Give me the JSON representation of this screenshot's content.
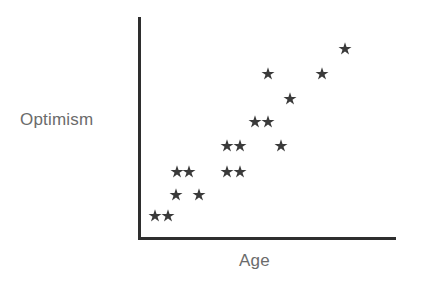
{
  "figure": {
    "background_color": "#ffffff",
    "axis_color": "#2e2e2e",
    "label_color": "#6b6b6b",
    "marker_color": "#3a3a3a",
    "marker_glyph": "asterisk-star"
  },
  "axes": {
    "x_label": "Age",
    "y_label": "Optimism"
  },
  "chart_data": {
    "type": "scatter",
    "title": "",
    "xlabel": "Age",
    "ylabel": "Optimism",
    "xlim": [
      0,
      100
    ],
    "ylim": [
      0,
      100
    ],
    "grid": false,
    "legend": null,
    "axis_ticks": {
      "x": [],
      "y": []
    },
    "marker": "asterisk-star",
    "marker_color": "#3a3a3a",
    "n_points": 17,
    "relationship": "positive linear association",
    "points": [
      {
        "x": 6.6,
        "y": 10.0
      },
      {
        "x": 11.7,
        "y": 10.0
      },
      {
        "x": 14.8,
        "y": 19.5
      },
      {
        "x": 23.8,
        "y": 19.5
      },
      {
        "x": 15.2,
        "y": 29.5
      },
      {
        "x": 19.9,
        "y": 29.5
      },
      {
        "x": 34.8,
        "y": 29.5
      },
      {
        "x": 39.8,
        "y": 29.5
      },
      {
        "x": 34.8,
        "y": 41.4
      },
      {
        "x": 39.8,
        "y": 41.4
      },
      {
        "x": 55.9,
        "y": 41.4
      },
      {
        "x": 45.7,
        "y": 52.3
      },
      {
        "x": 50.8,
        "y": 52.3
      },
      {
        "x": 59.4,
        "y": 62.7
      },
      {
        "x": 50.8,
        "y": 74.1
      },
      {
        "x": 71.9,
        "y": 74.1
      },
      {
        "x": 80.9,
        "y": 85.5
      }
    ],
    "pixel_points": [
      {
        "px": 155,
        "py": 216
      },
      {
        "px": 168,
        "py": 216
      },
      {
        "px": 176,
        "py": 195
      },
      {
        "px": 199,
        "py": 195
      },
      {
        "px": 177,
        "py": 172
      },
      {
        "px": 189,
        "py": 172
      },
      {
        "px": 227,
        "py": 172
      },
      {
        "px": 240,
        "py": 172
      },
      {
        "px": 227,
        "py": 146
      },
      {
        "px": 240,
        "py": 146
      },
      {
        "px": 281,
        "py": 146
      },
      {
        "px": 255,
        "py": 122
      },
      {
        "px": 268,
        "py": 122
      },
      {
        "px": 290,
        "py": 99
      },
      {
        "px": 268,
        "py": 74
      },
      {
        "px": 322,
        "py": 74
      },
      {
        "px": 345,
        "py": 49
      }
    ]
  }
}
